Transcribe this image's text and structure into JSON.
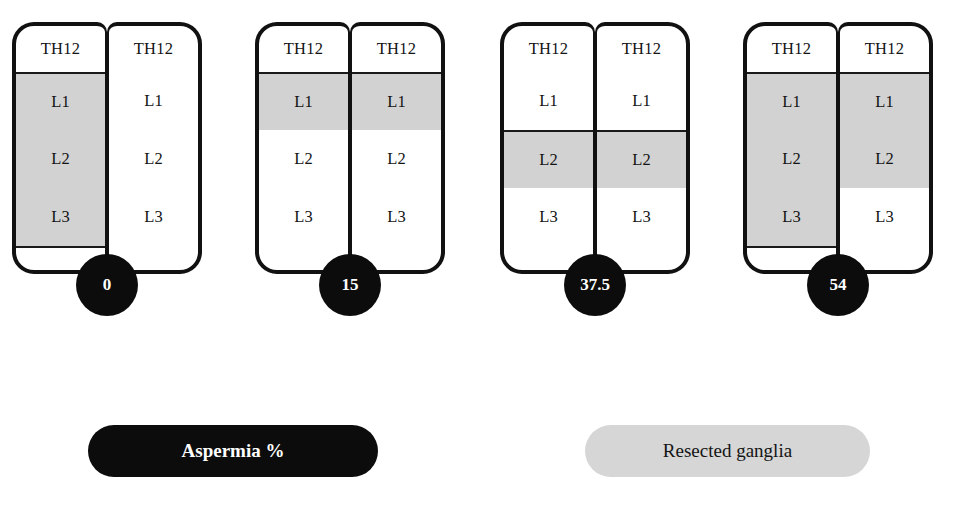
{
  "figure": {
    "shaded_color": "#d2d2d2",
    "dark_color": "#0c0c0c"
  },
  "levels": [
    "TH12",
    "L1",
    "L2",
    "L3"
  ],
  "legend": {
    "aspermia_label": "Aspermia %",
    "resected_label": "Resected ganglia"
  },
  "chart_data": {
    "type": "diagram",
    "title": "",
    "xlabel": "",
    "ylabel": "Aspermia %",
    "categories": [
      "Unilateral L1-L3",
      "Bilateral L1",
      "Bilateral L2",
      "Bilateral L1-L3 / L1-L2"
    ],
    "values": [
      0,
      15,
      37.5,
      54
    ],
    "legend_entries": [
      "Aspermia %",
      "Resected ganglia"
    ],
    "row_labels": [
      "TH12",
      "L1",
      "L2",
      "L3"
    ],
    "units": [
      {
        "value": "0",
        "left": {
          "TH12": false,
          "L1": true,
          "L2": true,
          "L3": true
        },
        "right": {
          "TH12": false,
          "L1": false,
          "L2": false,
          "L3": false
        }
      },
      {
        "value": "15",
        "left": {
          "TH12": false,
          "L1": true,
          "L2": false,
          "L3": false
        },
        "right": {
          "TH12": false,
          "L1": true,
          "L2": false,
          "L3": false
        }
      },
      {
        "value": "37.5",
        "left": {
          "TH12": false,
          "L1": false,
          "L2": true,
          "L3": false
        },
        "right": {
          "TH12": false,
          "L1": false,
          "L2": true,
          "L3": false
        }
      },
      {
        "value": "54",
        "left": {
          "TH12": false,
          "L1": true,
          "L2": true,
          "L3": true
        },
        "right": {
          "TH12": false,
          "L1": true,
          "L2": true,
          "L3": false
        }
      }
    ]
  }
}
